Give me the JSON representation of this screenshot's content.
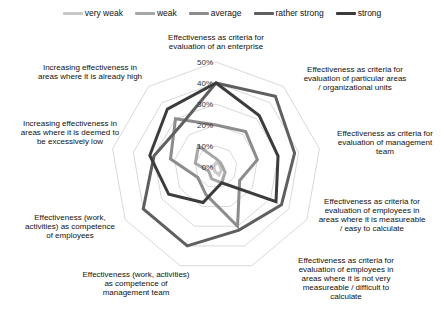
{
  "chart_data": {
    "type": "radar",
    "title": "",
    "axes": [
      "Effectiveness as criteria for evaluation of an enterprise",
      "Effectiveness as criteria for evaluation of particular areas / organizational units",
      "Effectiveness as criteria for evaluation of management team",
      "Effectiveness as criteria for evaluation of employees in areas where it is measureable / easy to calculate",
      "Effectiveness as criteria for evaluation of employees in areas where it is not very measureable / difficult to calculate",
      "Effectiveness (work, activities) as competence of management team",
      "Effectiveness (work, activities) as competence of employees",
      "Increasing effectiveness in areas where it is deemed to be excessively low",
      "Increasing effectiveness in areas where it is already high"
    ],
    "axis_label_lines": [
      [
        "Effectiveness as criteria for",
        "evaluation of an enterprise"
      ],
      [
        "Effectiveness as criteria for",
        "evaluation of particular areas",
        "/ organizational units"
      ],
      [
        "Effectiveness as criteria for",
        "evaluation of management",
        "team"
      ],
      [
        "Effectiveness as criteria for",
        "evaluation of employees in",
        "areas where it is measureable",
        "/ easy to calculate"
      ],
      [
        "Effectiveness as criteria for",
        "evaluation of employees in",
        "areas where it is not very",
        "measureable / difficult to",
        "calculate"
      ],
      [
        "Effectiveness (work, activities)",
        "as competence of",
        "management team"
      ],
      [
        "Effectiveness (work,",
        "activities) as competence",
        "of employees"
      ],
      [
        "Increasing effectiveness in",
        "areas where it is deemed to",
        "be excessively low"
      ],
      [
        "Increasing effectiveness in",
        "areas where it is already high"
      ]
    ],
    "ticks": [
      "0%",
      "10%",
      "20%",
      "30%",
      "40%",
      "50%"
    ],
    "rlim": [
      0,
      50
    ],
    "series": [
      {
        "name": "very weak",
        "color": "#c8c8c8",
        "values": [
          2,
          2,
          2,
          3,
          4,
          2,
          1,
          2,
          1
        ]
      },
      {
        "name": "weak",
        "color": "#a6a6a6",
        "values": [
          4,
          3,
          3,
          5,
          8,
          6,
          4,
          10,
          13
        ]
      },
      {
        "name": "average",
        "color": "#8c8c8c",
        "values": [
          20,
          22,
          20,
          13,
          30,
          14,
          10,
          22,
          30
        ]
      },
      {
        "name": "rather strong",
        "color": "#5f5f5f",
        "values": [
          40,
          44,
          38,
          36,
          32,
          40,
          40,
          30,
          26
        ]
      },
      {
        "name": "strong",
        "color": "#3c3c3c",
        "values": [
          40,
          32,
          30,
          33,
          8,
          18,
          26,
          32,
          36
        ]
      }
    ],
    "legend_position": "top",
    "grid": true
  },
  "legend": {
    "items": [
      "very weak",
      "weak",
      "average",
      "rather strong",
      "strong"
    ]
  }
}
